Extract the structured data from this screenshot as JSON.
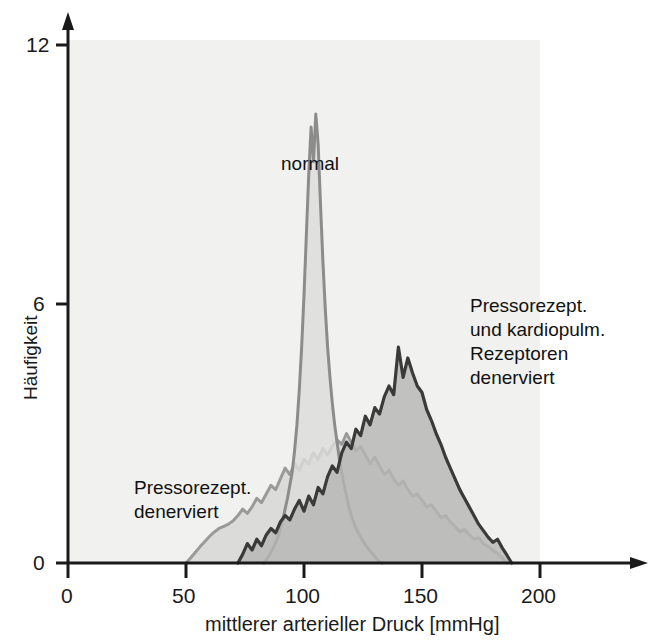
{
  "figure": {
    "background_color": "#ffffff",
    "plot_background_color": "#f1f1ef"
  },
  "axes": {
    "x": {
      "label": "mittlerer arterieller Druck [mmHg]",
      "ticks": [
        "0",
        "50",
        "100",
        "150",
        "200"
      ],
      "tick_values": [
        0,
        50,
        100,
        150,
        200
      ],
      "range": [
        0,
        200
      ]
    },
    "y": {
      "label": "Häufigkeit",
      "ticks": [
        "0",
        "6",
        "12"
      ],
      "tick_values": [
        0,
        6,
        12
      ],
      "range": [
        0,
        12
      ]
    }
  },
  "annotations": [
    {
      "name": "normal",
      "text": "normal",
      "x_px": 281,
      "y_px": 152
    },
    {
      "name": "pressorezept-denerviert",
      "text": "Pressorezept.\ndenerviert",
      "x_px": 134,
      "y_px": 476
    },
    {
      "name": "pressorezept-kardiopulm-denerviert",
      "text": "Pressorezept.\nund kardiopulm.\nRezeptoren\ndenerviert",
      "x_px": 470,
      "y_px": 294
    }
  ],
  "colors": {
    "normal_line": "#8c8c8c",
    "normal_fill": "#dcdcda",
    "light_line": "#9a9a9a",
    "light_fill": "#d6d6d4",
    "dark_line": "#3a3a3a",
    "dark_fill": "#b6b6b4",
    "axis": "#1a1a1a",
    "text": "#111111"
  },
  "chart_data": {
    "type": "area",
    "title": "",
    "xlabel": "mittlerer arterieller Druck [mmHg]",
    "ylabel": "Häufigkeit",
    "xlim": [
      0,
      200
    ],
    "ylim": [
      0,
      12
    ],
    "grid": false,
    "legend": "inline annotations",
    "series": [
      {
        "name": "normal",
        "label": "normal",
        "line_color": "#8c8c8c",
        "fill_color": "#dcdcda",
        "peak_x": 105,
        "peak_y": 10.4,
        "x": [
          83,
          85,
          87,
          89,
          91,
          93,
          95,
          96,
          97,
          98,
          99,
          100,
          101,
          102,
          103,
          104,
          105,
          106,
          107,
          108,
          109,
          110,
          111,
          112,
          113,
          114,
          115,
          116,
          117,
          118,
          119,
          120,
          121,
          122,
          124,
          126,
          128,
          130,
          131,
          132,
          133
        ],
        "y": [
          0.0,
          0.15,
          0.35,
          0.6,
          1.0,
          1.5,
          2.1,
          2.6,
          3.2,
          4.0,
          5.0,
          6.2,
          7.6,
          9.0,
          10.1,
          9.3,
          10.4,
          9.7,
          8.3,
          7.0,
          5.9,
          5.0,
          4.3,
          3.7,
          3.2,
          2.8,
          2.4,
          2.1,
          1.8,
          1.55,
          1.3,
          1.1,
          0.95,
          0.8,
          0.6,
          0.42,
          0.28,
          0.15,
          0.08,
          0.03,
          0.0
        ]
      },
      {
        "name": "pressorezept_denerviert",
        "label": "Pressorezept. denerviert",
        "line_color": "#9a9a9a",
        "fill_color": "#d6d6d4",
        "peak_x": 118,
        "peak_y": 3.0,
        "x": [
          50,
          52,
          54,
          56,
          58,
          60,
          62,
          64,
          66,
          68,
          70,
          72,
          74,
          76,
          78,
          80,
          82,
          84,
          86,
          88,
          90,
          92,
          94,
          96,
          98,
          100,
          102,
          104,
          106,
          108,
          110,
          112,
          114,
          116,
          118,
          120,
          122,
          124,
          126,
          128,
          130,
          132,
          134,
          136,
          138,
          140,
          142,
          144,
          146,
          148,
          150,
          152,
          154,
          156,
          158,
          160,
          162,
          164,
          166,
          168,
          170,
          172,
          174,
          176,
          178,
          180,
          182,
          184,
          186
        ],
        "y": [
          0.0,
          0.12,
          0.25,
          0.38,
          0.5,
          0.62,
          0.72,
          0.8,
          0.85,
          0.9,
          0.98,
          1.1,
          1.25,
          1.15,
          1.3,
          1.5,
          1.4,
          1.6,
          1.8,
          1.7,
          1.95,
          2.2,
          2.05,
          2.3,
          2.15,
          2.4,
          2.3,
          2.55,
          2.4,
          2.65,
          2.5,
          2.7,
          2.85,
          2.75,
          3.0,
          2.8,
          2.6,
          2.7,
          2.5,
          2.3,
          2.45,
          2.25,
          2.05,
          2.15,
          1.95,
          1.8,
          1.9,
          1.7,
          1.55,
          1.6,
          1.45,
          1.3,
          1.35,
          1.2,
          1.05,
          1.1,
          0.95,
          0.85,
          0.72,
          0.78,
          0.65,
          0.55,
          0.58,
          0.45,
          0.38,
          0.3,
          0.22,
          0.12,
          0.0
        ]
      },
      {
        "name": "pressorezept_und_kardiopulm_rezeptoren_denerviert",
        "label": "Pressorezept. und kardiopulm. Rezeptoren denerviert",
        "line_color": "#3a3a3a",
        "fill_color": "#b6b6b4",
        "peak_x": 140,
        "peak_y": 5.0,
        "x": [
          72,
          74,
          76,
          78,
          80,
          82,
          84,
          86,
          88,
          90,
          92,
          94,
          96,
          98,
          100,
          102,
          104,
          106,
          108,
          110,
          112,
          114,
          116,
          118,
          120,
          122,
          124,
          126,
          128,
          130,
          132,
          134,
          136,
          138,
          140,
          142,
          144,
          146,
          148,
          150,
          152,
          154,
          156,
          158,
          160,
          162,
          164,
          166,
          168,
          170,
          172,
          174,
          176,
          178,
          180,
          182,
          184,
          186,
          188
        ],
        "y": [
          0.0,
          0.2,
          0.45,
          0.3,
          0.55,
          0.4,
          0.65,
          0.8,
          0.7,
          0.95,
          1.1,
          1.0,
          1.25,
          1.45,
          1.2,
          1.55,
          1.35,
          1.75,
          1.6,
          2.0,
          2.25,
          2.1,
          2.55,
          2.8,
          2.65,
          3.1,
          2.95,
          3.4,
          3.2,
          3.6,
          3.45,
          3.85,
          4.1,
          3.9,
          5.0,
          4.3,
          4.75,
          4.4,
          4.1,
          3.95,
          3.55,
          3.3,
          3.0,
          2.75,
          2.45,
          2.2,
          1.95,
          1.7,
          1.5,
          1.3,
          1.1,
          0.9,
          0.75,
          0.6,
          0.48,
          0.55,
          0.35,
          0.18,
          0.0
        ]
      }
    ]
  }
}
